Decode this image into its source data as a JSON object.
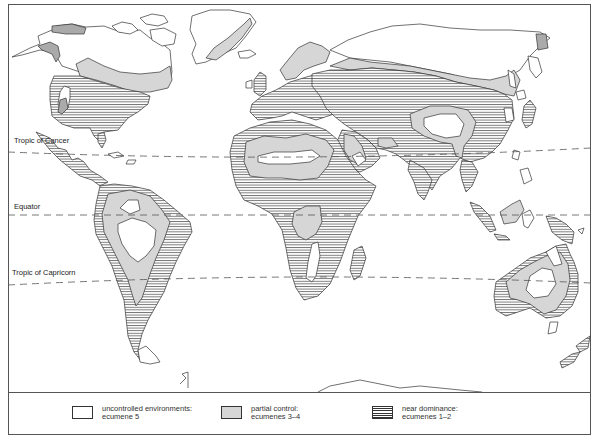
{
  "map": {
    "title": "World map of human control of environments (ecumenes)",
    "lines": [
      {
        "label": "Tropic of Cancer",
        "label_x": 14,
        "label_y": 138
      },
      {
        "label": "Equator",
        "label_x": 14,
        "label_y": 203
      },
      {
        "label": "Tropic of Capricorn",
        "label_x": 12,
        "label_y": 267
      }
    ],
    "colors": {
      "land_outline": "#333333",
      "partial_control_fill": "#d6d6d6",
      "uncontrolled_fill": "#ffffff",
      "hatch_line": "#333333",
      "dashed_line": "#555555"
    }
  },
  "legend": {
    "items": [
      {
        "swatch": "white",
        "line1": "uncontrolled environments:",
        "line2": "ecumene 5"
      },
      {
        "swatch": "grey",
        "line1": "partial control:",
        "line2": "ecumenes 3–4"
      },
      {
        "swatch": "lines",
        "line1": "near dominance:",
        "line2": "ecumenes 1–2"
      }
    ]
  }
}
